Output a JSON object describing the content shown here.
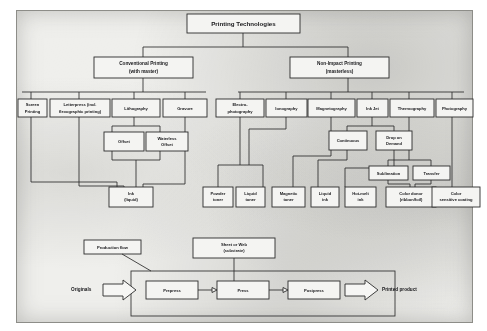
{
  "diagram": {
    "title": "Printing Technologies",
    "root": {
      "label": "Printing Technologies"
    },
    "branches": [
      {
        "id": "conventional",
        "line1": "Conventional Printing",
        "line2": "(with master)"
      },
      {
        "id": "nonimpact",
        "line1": "Non-Impact Printing",
        "line2": "(masterless)"
      }
    ],
    "conventional_methods": [
      {
        "id": "screen",
        "line1": "Screen",
        "line2": "Printing"
      },
      {
        "id": "letterpress",
        "line1": "Letterpress (incl.",
        "line2": "flexographic printing)"
      },
      {
        "id": "lithography",
        "line1": "Lithography",
        "line2": ""
      },
      {
        "id": "gravure",
        "line1": "Gravure",
        "line2": ""
      }
    ],
    "litho_variants": [
      {
        "id": "offset",
        "line1": "Offset",
        "line2": ""
      },
      {
        "id": "waterless-offset",
        "line1": "Waterless",
        "line2": "Offset"
      }
    ],
    "conventional_material": {
      "id": "ink-liquid",
      "line1": "Ink",
      "line2": "(liquid)"
    },
    "nonimpact_methods": [
      {
        "id": "electrophotography",
        "line1": "Electro-",
        "line2": "photography"
      },
      {
        "id": "ionography",
        "line1": "Ionography",
        "line2": ""
      },
      {
        "id": "magnetography",
        "line1": "Magnetography",
        "line2": ""
      },
      {
        "id": "inkjet",
        "line1": "Ink Jet",
        "line2": ""
      },
      {
        "id": "thermography",
        "line1": "Thermography",
        "line2": ""
      },
      {
        "id": "photography",
        "line1": "Photography",
        "line2": ""
      }
    ],
    "inkjet_variants": [
      {
        "id": "continuous",
        "line1": "Continuous",
        "line2": ""
      },
      {
        "id": "drop-on-demand",
        "line1": "Drop on",
        "line2": "Demand"
      }
    ],
    "thermo_variants": [
      {
        "id": "sublimation",
        "line1": "Sublimation",
        "line2": ""
      },
      {
        "id": "transfer",
        "line1": "Transfer",
        "line2": ""
      }
    ],
    "nonimpact_materials": [
      {
        "id": "powder-toner",
        "line1": "Powder",
        "line2": "toner"
      },
      {
        "id": "liquid-toner",
        "line1": "Liquid",
        "line2": "toner"
      },
      {
        "id": "magnetic-toner",
        "line1": "Magnetic",
        "line2": "toner"
      },
      {
        "id": "liquid-ink",
        "line1": "Liquid",
        "line2": "ink"
      },
      {
        "id": "hot-melt-ink",
        "line1": "Hot-melt",
        "line2": "ink"
      },
      {
        "id": "color-donor",
        "line1": "Color donor",
        "line2": "(ribbon/foil)"
      },
      {
        "id": "color-coating",
        "line1": "Color",
        "line2": "sensitive coating"
      }
    ]
  },
  "production": {
    "flow_label": "Production flow",
    "substrate": {
      "line1": "Sheet or Web",
      "line2": "(substrate)"
    },
    "input_label": "Originals",
    "output_label": "Printed product",
    "stages": [
      {
        "id": "prepress",
        "label": "Prepress"
      },
      {
        "id": "press",
        "label": "Press"
      },
      {
        "id": "postpress",
        "label": "Postpress"
      }
    ]
  },
  "colors": {
    "paper": "#efefec",
    "box_fill": "#f4f4f2",
    "stroke": "#2b2b2b",
    "text": "#17171a"
  }
}
